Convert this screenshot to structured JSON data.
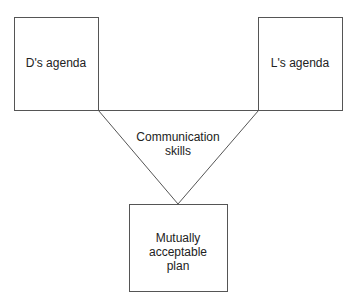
{
  "diagram": {
    "left_box": {
      "label": "D's agenda"
    },
    "right_box": {
      "label": "L's agenda"
    },
    "triangle": {
      "label_line1": "Communication",
      "label_line2": "skills"
    },
    "bottom_box": {
      "label_line1": "Mutually",
      "label_line2": "acceptable",
      "label_line3": "plan"
    },
    "line_color": "#444444"
  }
}
